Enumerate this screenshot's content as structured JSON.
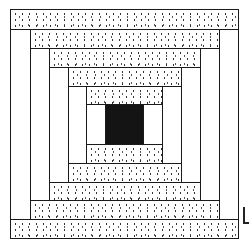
{
  "diagram": {
    "fills": {
      "stripe": "dotted",
      "column": "white",
      "center": "black"
    },
    "colors": {
      "outline": "#1a1a1a",
      "center": "#141414",
      "background": "#ffffff",
      "dots": "#333333"
    },
    "rings": [
      {
        "outer": [
          10,
          9,
          238,
          238
        ],
        "inner": [
          30,
          29,
          219,
          219
        ]
      },
      {
        "outer": [
          30,
          29,
          219,
          219
        ],
        "inner": [
          49,
          48,
          200,
          200
        ]
      },
      {
        "outer": [
          49,
          48,
          200,
          200
        ],
        "inner": [
          68,
          67,
          181,
          182
        ]
      },
      {
        "outer": [
          68,
          67,
          181,
          182
        ],
        "inner": [
          86,
          86,
          162,
          163
        ]
      },
      {
        "outer": [
          86,
          86,
          162,
          163
        ],
        "inner": [
          105,
          104,
          143,
          144
        ]
      }
    ],
    "center_square": [
      105,
      104,
      143,
      144
    ],
    "edge_mark": "L"
  }
}
